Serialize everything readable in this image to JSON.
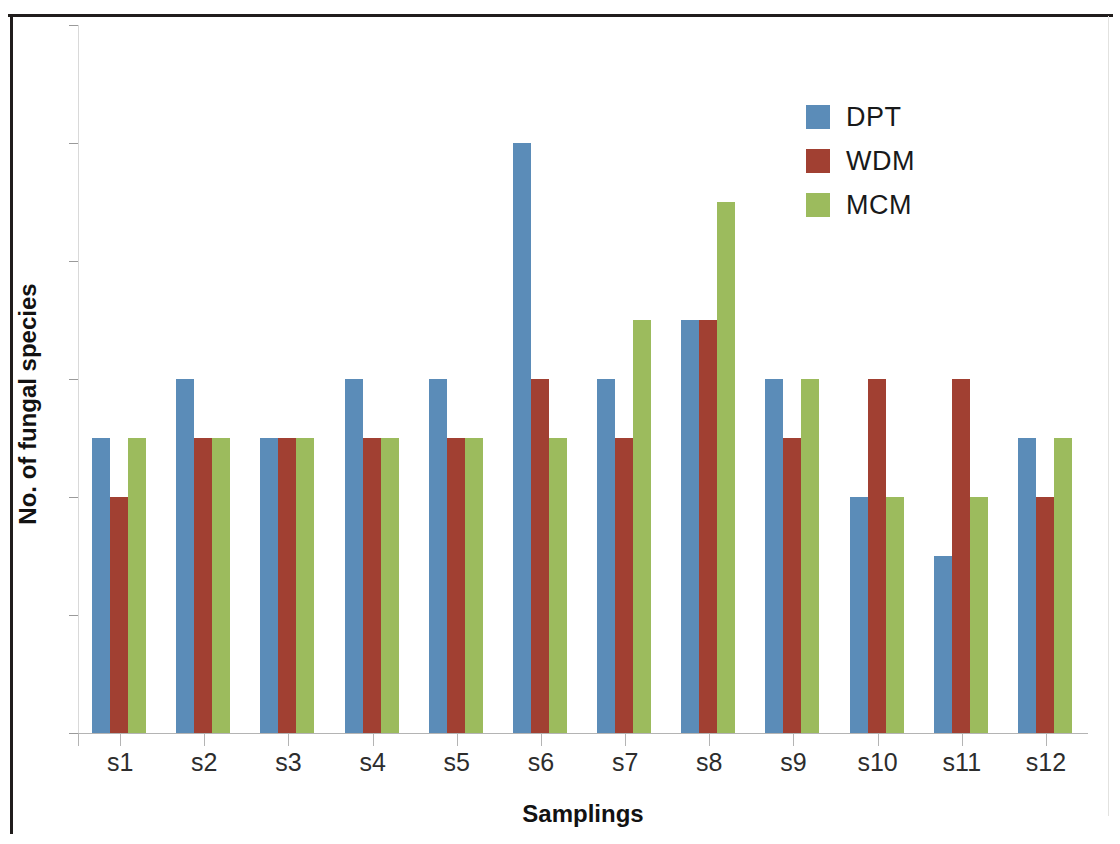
{
  "chart_data": {
    "type": "bar",
    "title": "",
    "xlabel": "Samplings",
    "ylabel": "No. of fungal species",
    "ylim": [
      0,
      12
    ],
    "ytick_step": 2,
    "yticks": [
      0,
      2,
      4,
      6,
      8,
      10,
      12
    ],
    "grid": false,
    "legend_position": "top-right",
    "categories": [
      "s1",
      "s2",
      "s3",
      "s4",
      "s5",
      "s6",
      "s7",
      "s8",
      "s9",
      "s10",
      "s11",
      "s12"
    ],
    "series": [
      {
        "name": "DPT",
        "color": "#5b8cb8",
        "values": [
          5,
          6,
          5,
          6,
          6,
          10,
          6,
          7,
          6,
          4,
          3,
          5
        ]
      },
      {
        "name": "WDM",
        "color": "#a14032",
        "values": [
          4,
          5,
          5,
          5,
          5,
          6,
          5,
          7,
          5,
          6,
          6,
          4
        ]
      },
      {
        "name": "MCM",
        "color": "#9cbb5d",
        "values": [
          5,
          5,
          5,
          5,
          5,
          5,
          7,
          9,
          6,
          4,
          4,
          5
        ]
      }
    ]
  },
  "axes": {
    "y_title": "No. of fungal species",
    "x_title": "Samplings",
    "y_tick_labels": [
      "12",
      "10",
      "8",
      "6",
      "4",
      "2",
      "0"
    ],
    "x_tick_labels": [
      "s1",
      "s2",
      "s3",
      "s4",
      "s5",
      "s6",
      "s7",
      "s8",
      "s9",
      "s10",
      "s11",
      "s12"
    ]
  },
  "legend": {
    "entries": [
      {
        "label": "DPT",
        "color": "#5b8cb8"
      },
      {
        "label": "WDM",
        "color": "#a14032"
      },
      {
        "label": "MCM",
        "color": "#9cbb5d"
      }
    ]
  }
}
